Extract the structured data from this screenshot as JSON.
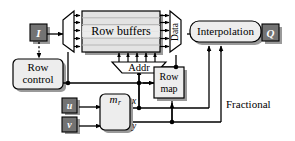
{
  "diagram": {
    "colors": {
      "io_fill": "#737373",
      "io_stroke": "#000000",
      "block_fill": "#ededed",
      "block_stroke": "#000000",
      "buffer_fill": "#e3e3e3",
      "buffer_band": "#f3f3f3",
      "shadow": "#9a9a9a",
      "line": "#000000",
      "text": "#000000",
      "io_text": "#ffffff"
    },
    "nodes": {
      "input_image": "I",
      "output_pixel": "Q",
      "row_control": "Row\ncontrol",
      "row_control_line1": "Row",
      "row_control_line2": "control",
      "row_buffers": "Row buffers",
      "data_mux": "Data",
      "addr_mux": "Addr",
      "row_map_line1": "Row",
      "row_map_line2": "map",
      "interpolation": "Interpolation",
      "coord_u": "u",
      "coord_v": "v",
      "mapper": "m",
      "mapper_sub": "r",
      "x_label": "x",
      "y_label": "y",
      "fractional_line1": "Fractional",
      "fractional_line2": "parts"
    },
    "counts": {
      "demux_outputs": 5,
      "mux_inputs": 5,
      "addr_inputs": 5,
      "buffer_bands": 6,
      "interpolation_inputs": 2
    }
  }
}
